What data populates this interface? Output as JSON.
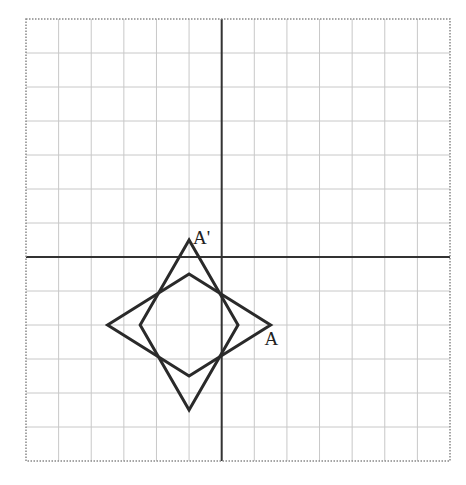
{
  "grid": {
    "left_px": 26,
    "top_px": 19,
    "right_px": 450,
    "bottom_px": 461,
    "cols": 13,
    "rows": 13,
    "x_min": -6,
    "x_max": 7,
    "y_min": -6,
    "y_max": 7,
    "grid_color": "#c8c8c8",
    "border_color": "#888888",
    "axis_color": "#333333"
  },
  "shapes": [
    {
      "name": "rhombus-original",
      "vertices": [
        [
          -3.5,
          -2
        ],
        [
          -1,
          -0.5
        ],
        [
          1.5,
          -2
        ],
        [
          -1,
          -3.5
        ]
      ],
      "stroke": "#2a2a2a",
      "stroke_width": 3
    },
    {
      "name": "rhombus-rotated",
      "vertices": [
        [
          -1,
          0.5
        ],
        [
          0.5,
          -2
        ],
        [
          -1,
          -4.5
        ],
        [
          -2.5,
          -2
        ]
      ],
      "stroke": "#2a2a2a",
      "stroke_width": 3
    }
  ],
  "labels": [
    {
      "name": "point-a-label",
      "text": "A",
      "x": 1.5,
      "y": -2,
      "dx": -6,
      "dy": 4
    },
    {
      "name": "point-a-prime-label",
      "text": "A'",
      "x": -1,
      "y": 0.5,
      "dx": 4,
      "dy": -12
    }
  ]
}
